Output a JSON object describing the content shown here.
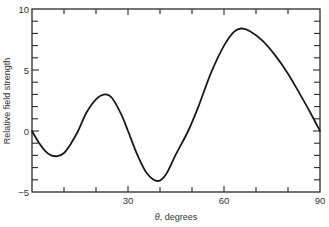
{
  "chart_data": {
    "type": "line",
    "title": "",
    "xlabel": "θ, degrees",
    "xlabel_symbol": "θ",
    "xlabel_text": ", degrees",
    "ylabel": "Relative field strength",
    "xlim": [
      0,
      90
    ],
    "ylim": [
      -5,
      10
    ],
    "grid": false,
    "legend": null,
    "x_ticks_labeled": [
      30,
      60,
      90
    ],
    "x_tick_labels": [
      "30",
      "60",
      "90"
    ],
    "x_minor_ticks": [
      10,
      20,
      30,
      40,
      50,
      60,
      70,
      80
    ],
    "y_ticks_labeled": [
      -5,
      0,
      5,
      10
    ],
    "y_tick_labels": [
      "−5",
      "0",
      "5",
      "10"
    ],
    "y_minor_ticks": [
      -4,
      -3,
      -2,
      -1,
      1,
      2,
      3,
      4,
      6,
      7,
      8,
      9
    ],
    "series": [
      {
        "name": "Relative field strength",
        "color": "#1a1a1a",
        "x": [
          0,
          2,
          4,
          6,
          8,
          10,
          12,
          14.4,
          17,
          20,
          22.8,
          25,
          28,
          30,
          33,
          36,
          39.4,
          42,
          45,
          48.8,
          52,
          56,
          60,
          63,
          65.3,
          68,
          72,
          76,
          80,
          84,
          87,
          90
        ],
        "y": [
          0,
          -0.9,
          -1.6,
          -2.0,
          -2.05,
          -1.8,
          -1.1,
          0,
          1.5,
          2.6,
          3.0,
          2.7,
          1.3,
          0,
          -2.0,
          -3.5,
          -4.1,
          -3.5,
          -1.9,
          0,
          2.0,
          4.8,
          7.0,
          8.1,
          8.4,
          8.2,
          7.4,
          6.2,
          4.7,
          2.9,
          1.5,
          0
        ]
      }
    ]
  }
}
